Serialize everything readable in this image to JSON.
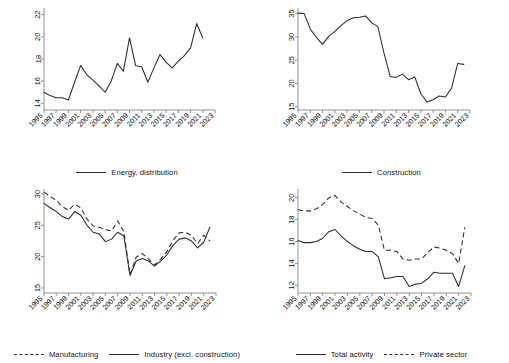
{
  "figure": {
    "name": "four-panel-line-chart",
    "panels": 4,
    "axis_color": "#7a7a7a",
    "line_color": "#2b2b2b"
  },
  "chart_data": [
    {
      "type": "line",
      "panel": "top-left",
      "title": "",
      "xlabel": "",
      "ylabel": "",
      "grid": false,
      "legend_position": "bottom-center",
      "xlim": [
        1995,
        2023
      ],
      "ylim": [
        13.4,
        22.6
      ],
      "yticks": [
        14,
        16,
        18,
        20,
        22
      ],
      "xticks": [
        1995,
        1997,
        1999,
        2001,
        2003,
        2005,
        2007,
        2009,
        2011,
        2013,
        2015,
        2017,
        2019,
        2021,
        2023
      ],
      "x": [
        1995,
        1996,
        1997,
        1998,
        1999,
        2000,
        2001,
        2002,
        2003,
        2004,
        2005,
        2006,
        2007,
        2008,
        2009,
        2010,
        2011,
        2012,
        2013,
        2014,
        2015,
        2016,
        2017,
        2018,
        2019,
        2020,
        2021
      ],
      "series": [
        {
          "name": "Energy, distribution",
          "style": "solid",
          "values": [
            15.0,
            14.7,
            14.5,
            14.5,
            14.3,
            15.9,
            17.4,
            16.6,
            16.1,
            15.6,
            15.0,
            16.0,
            17.6,
            16.9,
            19.9,
            17.4,
            17.3,
            15.9,
            17.2,
            18.4,
            17.7,
            17.2,
            17.8,
            18.3,
            19.0,
            21.2,
            19.9
          ]
        }
      ]
    },
    {
      "type": "line",
      "panel": "top-right",
      "title": "",
      "xlabel": "",
      "ylabel": "",
      "grid": false,
      "legend_position": "bottom-center",
      "xlim": [
        1995,
        2023
      ],
      "ylim": [
        14.3,
        36.2
      ],
      "yticks": [
        15,
        20,
        25,
        30,
        35
      ],
      "xticks": [
        1995,
        1997,
        1999,
        2001,
        2003,
        2005,
        2007,
        2009,
        2011,
        2013,
        2015,
        2017,
        2019,
        2021,
        2023
      ],
      "x": [
        1995,
        1996,
        1997,
        1998,
        1999,
        2000,
        2001,
        2002,
        2003,
        2004,
        2005,
        2006,
        2007,
        2008,
        2009,
        2010,
        2011,
        2012,
        2013,
        2014,
        2015,
        2016,
        2017,
        2018,
        2019,
        2020,
        2021,
        2022
      ],
      "series": [
        {
          "name": "Construction",
          "style": "solid",
          "values": [
            35.1,
            35.0,
            31.7,
            29.9,
            28.4,
            30.1,
            31.2,
            32.4,
            33.5,
            34.1,
            34.2,
            34.5,
            33.0,
            32.2,
            26.5,
            21.5,
            21.3,
            22.0,
            20.8,
            21.4,
            17.8,
            16.0,
            16.5,
            17.3,
            17.1,
            19.0,
            24.3,
            24.1
          ]
        }
      ]
    },
    {
      "type": "line",
      "panel": "bottom-left",
      "title": "",
      "xlabel": "",
      "ylabel": "",
      "grid": false,
      "legend_position": "bottom-center",
      "xlim": [
        1995,
        2023
      ],
      "ylim": [
        14.2,
        30.8
      ],
      "yticks": [
        15,
        20,
        25,
        30
      ],
      "xticks": [
        1995,
        1997,
        1999,
        2001,
        2003,
        2005,
        2007,
        2009,
        2011,
        2013,
        2015,
        2017,
        2019,
        2021,
        2023
      ],
      "x": [
        1995,
        1996,
        1997,
        1998,
        1999,
        2000,
        2001,
        2002,
        2003,
        2004,
        2005,
        2006,
        2007,
        2008,
        2009,
        2010,
        2011,
        2012,
        2013,
        2014,
        2015,
        2016,
        2017,
        2018,
        2019,
        2020,
        2021,
        2022
      ],
      "series": [
        {
          "name": "Manufacturing",
          "style": "dashed",
          "values": [
            30.3,
            29.6,
            29.0,
            28.0,
            27.4,
            28.4,
            27.8,
            26.0,
            24.9,
            24.7,
            24.3,
            24.1,
            25.7,
            24.0,
            17.1,
            19.9,
            20.5,
            19.6,
            18.7,
            19.6,
            20.8,
            22.6,
            23.8,
            23.9,
            23.4,
            22.1,
            23.4,
            22.5
          ]
        },
        {
          "name": "Industry (excl. construction)",
          "style": "solid",
          "values": [
            28.5,
            27.8,
            27.2,
            26.4,
            26.0,
            27.2,
            26.6,
            25.0,
            23.9,
            23.6,
            22.4,
            22.8,
            23.9,
            23.3,
            17.0,
            19.3,
            19.7,
            19.3,
            18.5,
            19.3,
            20.3,
            21.8,
            22.8,
            23.0,
            22.5,
            21.4,
            22.3,
            24.7
          ]
        }
      ]
    },
    {
      "type": "line",
      "panel": "bottom-right",
      "title": "",
      "xlabel": "",
      "ylabel": "",
      "grid": false,
      "legend_position": "bottom-center",
      "xlim": [
        1995,
        2023
      ],
      "ylim": [
        11.3,
        20.8
      ],
      "yticks": [
        12,
        14,
        16,
        18,
        20
      ],
      "xticks": [
        1995,
        1997,
        1999,
        2001,
        2003,
        2005,
        2007,
        2009,
        2011,
        2013,
        2015,
        2017,
        2019,
        2021,
        2023
      ],
      "x": [
        1995,
        1996,
        1997,
        1998,
        1999,
        2000,
        2001,
        2002,
        2003,
        2004,
        2005,
        2006,
        2007,
        2008,
        2009,
        2010,
        2011,
        2012,
        2013,
        2014,
        2015,
        2016,
        2017,
        2018,
        2019,
        2020,
        2021,
        2022
      ],
      "series": [
        {
          "name": "Total activity",
          "style": "solid",
          "values": [
            16.1,
            15.9,
            15.9,
            16.0,
            16.3,
            16.9,
            17.1,
            16.5,
            16.0,
            15.6,
            15.3,
            15.1,
            15.1,
            14.6,
            12.6,
            12.7,
            12.8,
            12.8,
            11.9,
            12.1,
            12.2,
            12.6,
            13.2,
            13.1,
            13.1,
            13.1,
            11.9,
            13.8
          ]
        },
        {
          "name": "Private sector",
          "style": "dashed",
          "values": [
            18.9,
            18.8,
            18.8,
            19.0,
            19.4,
            20.0,
            20.2,
            19.6,
            19.2,
            18.8,
            18.5,
            18.2,
            18.1,
            17.5,
            15.2,
            15.2,
            15.1,
            14.4,
            14.3,
            14.4,
            14.4,
            15.0,
            15.5,
            15.4,
            15.2,
            14.9,
            14.0,
            17.3
          ]
        }
      ]
    }
  ]
}
